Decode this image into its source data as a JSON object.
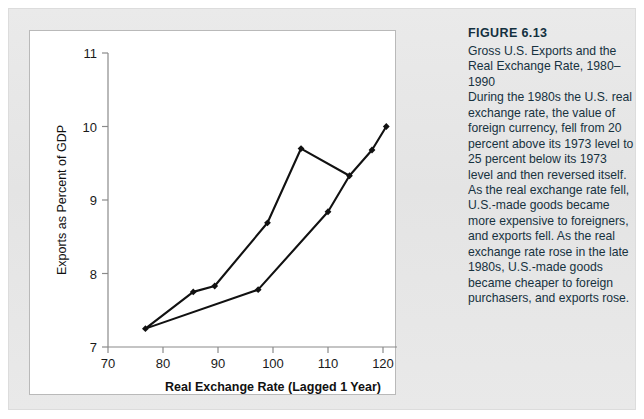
{
  "figure": {
    "number_label": "FIGURE 6.13",
    "subtitle": "Gross U.S. Exports and the Real Exchange Rate, 1980–1990",
    "body": "During the 1980s the U.S. real exchange rate, the value of foreign currency, fell from 20 percent above its 1973 level to 25 percent below its 1973 level and then reversed itself. As the real exchange rate fell, U.S.-made goods became more expensive to foreigners, and exports fell. As the real exchange rate rose in the late 1980s, U.S.-made goods became cheaper to foreign purchasers, and exports rose."
  },
  "chart_data": {
    "type": "line",
    "title": "",
    "xlabel": "Real Exchange Rate (Lagged 1 Year)",
    "ylabel": "Exports as Percent of GDP",
    "xlim": [
      70,
      130
    ],
    "ylim": [
      7,
      11
    ],
    "xticks": [
      70,
      80,
      90,
      100,
      110,
      120,
      130
    ],
    "yticks": [
      7,
      8,
      9,
      10,
      11
    ],
    "xtick_labels": [
      "70",
      "80",
      "90",
      "100",
      "110",
      "120",
      "130"
    ],
    "ytick_labels": [
      "7",
      "8",
      "9",
      "10",
      "11"
    ],
    "grid": false,
    "legend": false,
    "marker": "diamond",
    "line_color": "#111111",
    "series": [
      {
        "name": "Exports vs. real exchange rate, 1980-1990",
        "points": [
          [
            76.8,
            7.25
          ],
          [
            85.5,
            7.75
          ],
          [
            89.4,
            7.83
          ],
          [
            99.0,
            8.69
          ],
          [
            105.1,
            9.7
          ],
          [
            113.9,
            9.33
          ],
          [
            110.0,
            8.84
          ],
          [
            97.3,
            7.78
          ],
          [
            76.8,
            7.25
          ]
        ]
      },
      {
        "name": "Upswing branch, late 1980s",
        "points": [
          [
            113.9,
            9.33
          ],
          [
            118.0,
            9.68
          ],
          [
            120.6,
            10.0
          ]
        ]
      }
    ]
  }
}
